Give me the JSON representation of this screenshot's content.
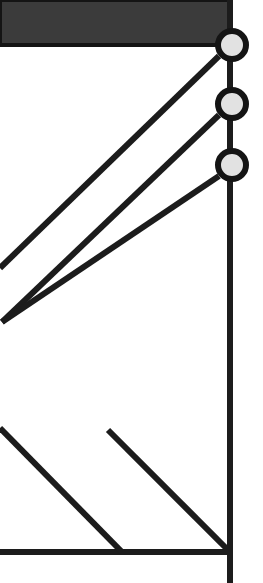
{
  "canvas": {
    "width": 263,
    "height": 583,
    "background_color": "#ffffff",
    "title": "Schematic line diagram fragment"
  },
  "colors": {
    "stroke": "#1c1c1c",
    "header_fill": "#3b3b3b",
    "header_edge": "#141414",
    "node_fill": "#e2e2e2",
    "node_stroke": "#141414",
    "background": "#ffffff"
  },
  "header_bar": {
    "name": "header-bar",
    "x": 0,
    "y": 0,
    "width": 230,
    "height": 45,
    "fill": "#3b3b3b",
    "label": ""
  },
  "rails": [
    {
      "name": "vertical-rail",
      "orientation": "vertical",
      "x1": 230,
      "y1": 0,
      "x2": 230,
      "y2": 583,
      "stroke_width": 6
    },
    {
      "name": "horizontal-baseline",
      "orientation": "horizontal",
      "x1": 0,
      "y1": 552,
      "x2": 230,
      "y2": 552,
      "stroke_width": 6
    }
  ],
  "nodes": [
    {
      "name": "node-1",
      "cx": 232,
      "cy": 45,
      "r": 14,
      "ring_width": 6,
      "fill": "#e2e2e2",
      "label": "1"
    },
    {
      "name": "node-2",
      "cx": 232,
      "cy": 104,
      "r": 14,
      "ring_width": 6,
      "fill": "#e2e2e2",
      "label": "2"
    },
    {
      "name": "node-3",
      "cx": 232,
      "cy": 165,
      "r": 14,
      "ring_width": 6,
      "fill": "#e2e2e2",
      "label": "3"
    }
  ],
  "diagonals": [
    {
      "name": "diagonal-from-node-1",
      "x1": 219,
      "y1": 56,
      "x2": 0,
      "y2": 268,
      "stroke_width": 6,
      "angle_deg": 45
    },
    {
      "name": "diagonal-from-node-2",
      "x1": 219,
      "y1": 115,
      "x2": 2,
      "y2": 322,
      "stroke_width": 6,
      "angle_deg": 45
    },
    {
      "name": "diagonal-from-node-3",
      "x1": 219,
      "y1": 176,
      "x2": 2,
      "y2": 322,
      "stroke_width": 6,
      "angle_deg": -45
    },
    {
      "name": "diagonal-lower-left",
      "x1": 0,
      "y1": 428,
      "x2": 122,
      "y2": 552,
      "stroke_width": 6,
      "angle_deg": -45
    },
    {
      "name": "diagonal-to-corner",
      "x1": 108,
      "y1": 430,
      "x2": 230,
      "y2": 552,
      "stroke_width": 6,
      "angle_deg": -45
    }
  ],
  "legend": {
    "node_count_label": "3",
    "line_count_label": "5"
  }
}
